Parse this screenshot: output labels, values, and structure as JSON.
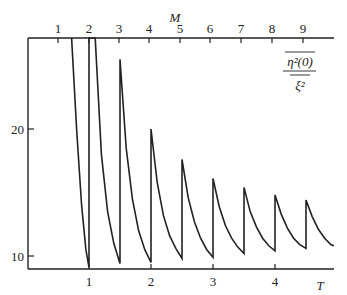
{
  "chart_data": {
    "type": "line",
    "title": "",
    "ylabel_annotation": {
      "numerator": "η²(0)",
      "denominator": "ξ²",
      "overline_numerator": true
    },
    "xlabel": "T",
    "x2label": "M",
    "x_ticks": [
      "1",
      "2",
      "3",
      "4"
    ],
    "x_tick_values": [
      1,
      2,
      3,
      4
    ],
    "x2_ticks": [
      "1",
      "2",
      "3",
      "4",
      "5",
      "6",
      "7",
      "8",
      "9"
    ],
    "y_ticks": [
      "10",
      "20"
    ],
    "y_tick_values": [
      10,
      20
    ],
    "xlim": [
      0,
      4.95
    ],
    "ylim": [
      9.0,
      27.2
    ],
    "grid": false,
    "legend": null,
    "series": [
      {
        "name": "sawtooth",
        "description": "Decaying curve between half-integer T values with vertical jumps at T = 1, 1.5, 2, 2.5, 3, 3.5, 4, 4.5",
        "points": [
          [
            0.72,
            27.2
          ],
          [
            0.8,
            20.0
          ],
          [
            0.88,
            14.0
          ],
          [
            0.95,
            10.5
          ],
          [
            1.0,
            9.1
          ],
          [
            1.0,
            27.2
          ],
          [
            1.1,
            27.2
          ],
          [
            1.2,
            18.0
          ],
          [
            1.3,
            13.5
          ],
          [
            1.4,
            11.0
          ],
          [
            1.5,
            9.4
          ],
          [
            1.5,
            25.5
          ],
          [
            1.6,
            18.5
          ],
          [
            1.7,
            14.5
          ],
          [
            1.8,
            12.0
          ],
          [
            1.9,
            10.5
          ],
          [
            2.0,
            9.5
          ],
          [
            2.0,
            20.0
          ],
          [
            2.1,
            15.8
          ],
          [
            2.2,
            13.2
          ],
          [
            2.3,
            11.6
          ],
          [
            2.4,
            10.6
          ],
          [
            2.5,
            9.8
          ],
          [
            2.5,
            17.6
          ],
          [
            2.6,
            14.6
          ],
          [
            2.7,
            12.7
          ],
          [
            2.8,
            11.4
          ],
          [
            2.9,
            10.5
          ],
          [
            3.0,
            9.9
          ],
          [
            3.0,
            16.1
          ],
          [
            3.1,
            13.9
          ],
          [
            3.2,
            12.4
          ],
          [
            3.3,
            11.4
          ],
          [
            3.4,
            10.7
          ],
          [
            3.5,
            10.2
          ],
          [
            3.5,
            15.4
          ],
          [
            3.6,
            13.5
          ],
          [
            3.7,
            12.3
          ],
          [
            3.8,
            11.4
          ],
          [
            3.9,
            10.8
          ],
          [
            4.0,
            10.4
          ],
          [
            4.0,
            14.8
          ],
          [
            4.1,
            13.3
          ],
          [
            4.2,
            12.2
          ],
          [
            4.3,
            11.4
          ],
          [
            4.4,
            10.9
          ],
          [
            4.5,
            10.6
          ],
          [
            4.5,
            14.4
          ],
          [
            4.6,
            13.1
          ],
          [
            4.7,
            12.1
          ],
          [
            4.8,
            11.4
          ],
          [
            4.9,
            10.9
          ],
          [
            4.95,
            10.8
          ]
        ]
      }
    ],
    "peaks": [
      {
        "T": 1.5,
        "value": 25.5
      },
      {
        "T": 2.0,
        "value": 20.0
      },
      {
        "T": 2.5,
        "value": 17.6
      },
      {
        "T": 3.0,
        "value": 16.1
      },
      {
        "T": 3.5,
        "value": 15.4
      },
      {
        "T": 4.0,
        "value": 14.8
      },
      {
        "T": 4.5,
        "value": 14.4
      }
    ],
    "minima": [
      {
        "T": 1.0,
        "value": 9.1
      },
      {
        "T": 1.5,
        "value": 9.4
      },
      {
        "T": 2.0,
        "value": 9.5
      },
      {
        "T": 2.5,
        "value": 9.8
      },
      {
        "T": 3.0,
        "value": 9.9
      },
      {
        "T": 3.5,
        "value": 10.2
      },
      {
        "T": 4.0,
        "value": 10.4
      },
      {
        "T": 4.5,
        "value": 10.6
      }
    ]
  },
  "axes": {
    "bottom_label": "T",
    "top_label": "M",
    "bottom_ticks": [
      "1",
      "2",
      "3",
      "4"
    ],
    "top_ticks": [
      "1",
      "2",
      "3",
      "4",
      "5",
      "6",
      "7",
      "8",
      "9"
    ],
    "left_ticks": [
      "10",
      "20"
    ],
    "annotation_numerator": "η²(0)",
    "annotation_denominator": "ξ²"
  },
  "colors": {
    "line": "#222222",
    "axis": "#222222",
    "background": "#ffffff"
  }
}
